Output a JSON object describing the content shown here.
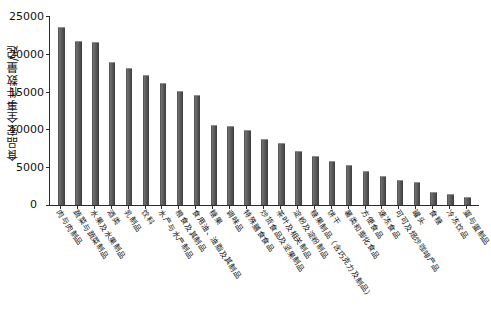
{
  "chart_data": {
    "type": "bar",
    "title": "",
    "xlabel": "",
    "ylabel": "食品安全事件数量/起",
    "ylim": [
      0,
      25000
    ],
    "y_ticks": [
      0,
      5000,
      10000,
      15000,
      20000,
      25000
    ],
    "y_tick_labels": [
      "0",
      "5000",
      "10000",
      "15000",
      "20000",
      "25000"
    ],
    "grid": false,
    "legend": null,
    "bar_color": "#5a5a5a",
    "categories": [
      "肉与肉制品",
      "蔬菜与蔬菜制品",
      "水果及水果制品",
      "酒类",
      "乳制品",
      "饮料",
      "水产与水产制品",
      "粮食及其制品",
      "食用油、油脂及其制品",
      "糖果",
      "调味品",
      "特殊膳食食品",
      "炒货食品及坚果制品",
      "茶叶及相关制品",
      "淀粉及淀粉制品",
      "糖果制品（含巧克力及制品）",
      "饼干",
      "薯类和膨化食品",
      "方便食品",
      "速冻食品",
      "可可及焙炒咖啡产品",
      "罐头",
      "食糖",
      "冷冻饮品",
      "蛋与蛋制品"
    ],
    "values": [
      23500,
      21700,
      21600,
      18900,
      18100,
      17200,
      16200,
      15100,
      14500,
      10600,
      10400,
      9900,
      8700,
      8200,
      7100,
      6500,
      5800,
      5300,
      4500,
      3800,
      3300,
      3000,
      1700,
      1400,
      1000
    ]
  }
}
